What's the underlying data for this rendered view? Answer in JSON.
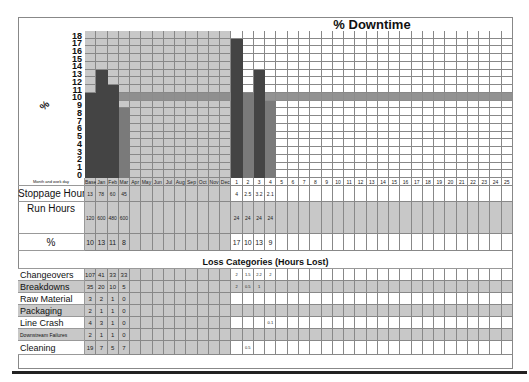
{
  "chart_data": {
    "type": "bar",
    "title": "% Downtime",
    "ylabel": "%",
    "xlabel": "Month and work day",
    "ylim": [
      0,
      18
    ],
    "yticks": [
      0,
      1,
      2,
      3,
      4,
      5,
      6,
      7,
      8,
      9,
      10,
      11,
      12,
      13,
      14,
      15,
      16,
      17,
      18
    ],
    "target_line": 10,
    "categories": [
      "Base",
      "Jan",
      "Feb",
      "Mar",
      "Apr",
      "May",
      "Jun",
      "Jul",
      "Aug",
      "Sep",
      "Oct",
      "Nov",
      "Dec",
      "1",
      "2",
      "3",
      "4",
      "5",
      "6",
      "7",
      "8",
      "9",
      "10",
      "11",
      "12",
      "13",
      "14",
      "15",
      "16",
      "17",
      "18",
      "19",
      "20",
      "21",
      "22",
      "23",
      "24",
      "25"
    ],
    "values": [
      10,
      13,
      11,
      8,
      null,
      null,
      null,
      null,
      null,
      null,
      null,
      null,
      null,
      17,
      10,
      13,
      9,
      null,
      null,
      null,
      null,
      null,
      null,
      null,
      null,
      null,
      null,
      null,
      null,
      null,
      null,
      null,
      null,
      null,
      null,
      null,
      null,
      null
    ],
    "grid": true
  },
  "labels": {
    "title": "% Downtime",
    "y_axis": "%",
    "month_row": "Month and work day",
    "stoppage": "Stoppage Hours",
    "run": "Run Hours",
    "percent": "%",
    "loss_title": "Loss Categories  (Hours Lost)"
  },
  "colors": {
    "month_shade": "#c8c8c8",
    "bar_dark": "#444444",
    "bar_mid": "#7a7a7a",
    "target_band": "#8c8c8c",
    "grid_line": "#888888"
  },
  "table": {
    "stoppage": [
      "13",
      "78",
      "60",
      "45",
      "",
      "",
      "",
      "",
      "",
      "",
      "",
      "",
      "",
      "4",
      "2.5",
      "3.2",
      "2.1"
    ],
    "run": [
      "120",
      "600",
      "480",
      "600",
      "",
      "",
      "",
      "",
      "",
      "",
      "",
      "",
      "",
      "24",
      "24",
      "24",
      "24"
    ],
    "percent": [
      "10",
      "13",
      "11",
      "8",
      "",
      "",
      "",
      "",
      "",
      "",
      "",
      "",
      "",
      "17",
      "10",
      "13",
      "9"
    ]
  },
  "loss_categories": [
    {
      "name": "Changeovers",
      "values": [
        "107",
        "41",
        "33",
        "33",
        "",
        "",
        "",
        "",
        "",
        "",
        "",
        "",
        "",
        "2",
        "1.5",
        "2.2",
        "2"
      ]
    },
    {
      "name": "Breakdowns",
      "values": [
        "35",
        "20",
        "10",
        "5",
        "",
        "",
        "",
        "",
        "",
        "",
        "",
        "",
        "",
        "2",
        "0.5",
        "1",
        ""
      ]
    },
    {
      "name": "Raw Material",
      "values": [
        "3",
        "2",
        "1",
        "0"
      ]
    },
    {
      "name": "Packaging",
      "values": [
        "2",
        "1",
        "1",
        "0"
      ]
    },
    {
      "name": "Line Crash",
      "values": [
        "4",
        "3",
        "1",
        "0",
        "",
        "",
        "",
        "",
        "",
        "",
        "",
        "",
        "",
        "",
        "",
        "",
        "0.1"
      ]
    },
    {
      "name": "Downstream Failures",
      "values": [
        "2",
        "1",
        "1",
        "0"
      ]
    },
    {
      "name": "Cleaning",
      "values": [
        "19",
        "7",
        "5",
        "7",
        "",
        "",
        "",
        "",
        "",
        "",
        "",
        "",
        "",
        "",
        "0.5"
      ]
    }
  ]
}
